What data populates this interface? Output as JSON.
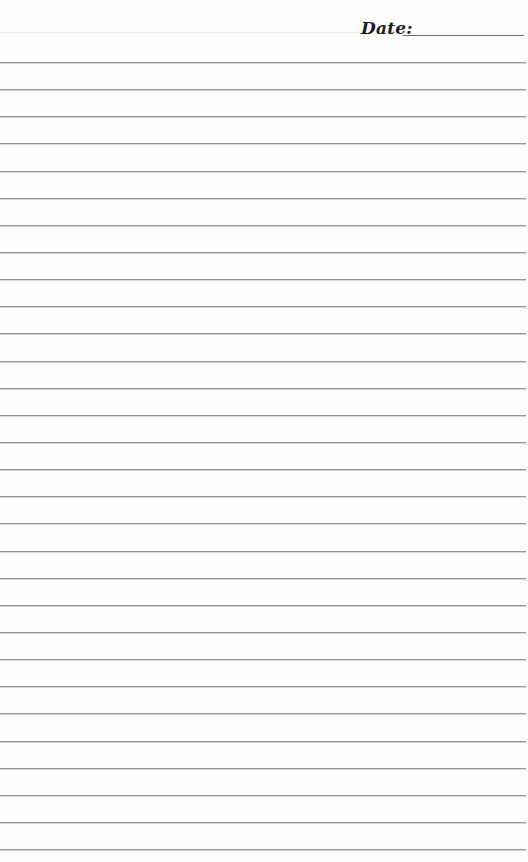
{
  "header": {
    "date_label": "Date:",
    "date_value": ""
  },
  "paper": {
    "type": "lined-notebook-page",
    "line_count": 30,
    "first_line_y": 62,
    "line_spacing": 27.14,
    "line_color": "#949494",
    "background_color": "#fefefe"
  }
}
